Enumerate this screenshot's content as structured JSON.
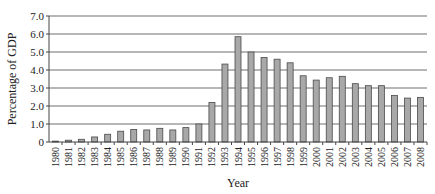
{
  "chart_data": {
    "type": "bar",
    "title": "",
    "xlabel": "Year",
    "ylabel": "Percentage of GDP",
    "ylim": [
      0,
      7.0
    ],
    "yticks": [
      "0",
      "1.0",
      "2.0",
      "3.0",
      "4.0",
      "5.0",
      "6.0",
      "7.0"
    ],
    "grid": true,
    "legend": null,
    "categories": [
      "1980",
      "1981",
      "1982",
      "1983",
      "1984",
      "1985",
      "1986",
      "1987",
      "1988",
      "1989",
      "1990",
      "1991",
      "1992",
      "1993",
      "1994",
      "1995",
      "1996",
      "1997",
      "1998",
      "1999",
      "2000",
      "2001",
      "2002",
      "2003",
      "2004",
      "2005",
      "2006",
      "2007",
      "2008"
    ],
    "values": [
      0.05,
      0.1,
      0.15,
      0.28,
      0.43,
      0.6,
      0.7,
      0.67,
      0.76,
      0.67,
      0.8,
      1.0,
      2.2,
      4.33,
      5.85,
      5.0,
      4.7,
      4.6,
      4.4,
      3.68,
      3.44,
      3.57,
      3.65,
      3.24,
      3.13,
      3.13,
      2.59,
      2.44,
      2.48
    ],
    "colors": {
      "bar_fill": "#a8a8a8",
      "bar_stroke": "#4a4a4a",
      "grid": "#6e6e6e"
    }
  }
}
